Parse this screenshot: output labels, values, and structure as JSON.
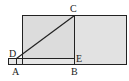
{
  "diagram": {
    "labels": {
      "A": "A",
      "B": "B",
      "C": "C",
      "D": "D",
      "E": "E"
    },
    "colors": {
      "fill": "#e2e2e2",
      "stroke": "#222222",
      "background": "#ffffff"
    }
  }
}
